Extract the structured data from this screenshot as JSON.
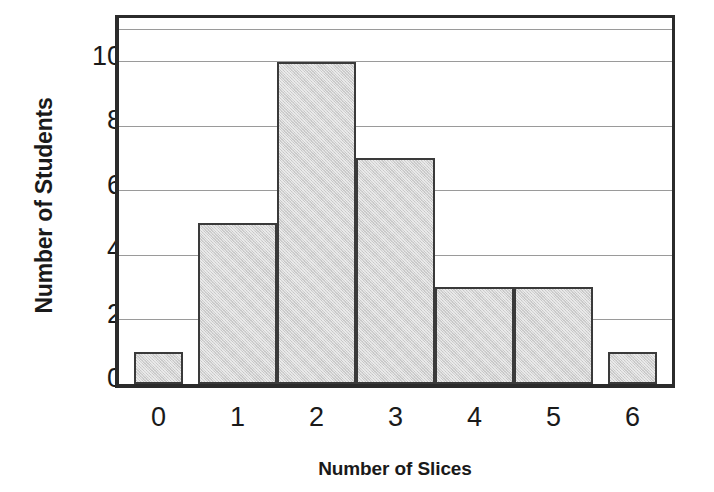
{
  "chart_data": {
    "type": "bar",
    "title": "",
    "xlabel": "Number of Slices",
    "ylabel": "Number of Students",
    "categories": [
      "0",
      "1",
      "2",
      "3",
      "4",
      "5",
      "6"
    ],
    "values": [
      1,
      5,
      10,
      7,
      3,
      3,
      1
    ],
    "series": [
      {
        "name": "Number of Students",
        "values": [
          1,
          5,
          10,
          7,
          3,
          3,
          1
        ]
      }
    ],
    "ylim": [
      0,
      11.35
    ],
    "xlim": [
      -0.5,
      6.5
    ],
    "y_ticks": [
      0,
      2,
      4,
      6,
      8,
      10
    ],
    "y_tick_labels": [
      "0",
      "2",
      "4",
      "6",
      "8",
      "10"
    ],
    "x_tick_labels": [
      "0",
      "1",
      "2",
      "3",
      "4",
      "5",
      "6"
    ],
    "gridlines": [
      2,
      4,
      6,
      8,
      10,
      11
    ],
    "grid": true,
    "grid_axis": "y",
    "legend": false,
    "legend_position": "none",
    "bar_fill_color": "#d2d2d2",
    "bar_edge_color": "#3a3a3a",
    "grid_color": "#9a9a9a",
    "axis_color": "#2b2b2b",
    "background_color": "#ffffff",
    "annotations": []
  }
}
